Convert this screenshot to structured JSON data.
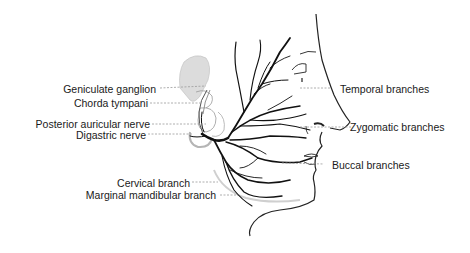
{
  "diagram": {
    "labels_left": [
      {
        "id": "geniculate-ganglion",
        "text": "Geniculate ganglion"
      },
      {
        "id": "chorda-tympani",
        "text": "Chorda tympani"
      },
      {
        "id": "posterior-auricular-nerve",
        "text": "Posterior auricular nerve"
      },
      {
        "id": "digastric-nerve",
        "text": "Digastric nerve"
      },
      {
        "id": "cervical-branch",
        "text": "Cervical branch"
      },
      {
        "id": "marginal-mandibular-branch",
        "text": "Marginal mandibular branch"
      }
    ],
    "labels_right": [
      {
        "id": "temporal-branches",
        "text": "Temporal branches"
      },
      {
        "id": "zygomatic-branches",
        "text": "Zygomatic branches"
      },
      {
        "id": "buccal-branches",
        "text": "Buccal branches"
      }
    ],
    "colors": {
      "nerve": "#111111",
      "outline": "#222222",
      "leader": "#9a9a9a",
      "shading": "#d4d4d4",
      "text": "#1a1a1a"
    }
  }
}
